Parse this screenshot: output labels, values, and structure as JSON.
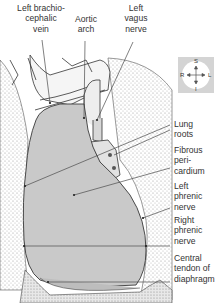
{
  "diagram": {
    "type": "anatomical-illustration",
    "colors": {
      "pericardium_fill": "#c9c9c9",
      "lung_stipple": "#bdbdbd",
      "outline": "#3a3a3a",
      "leader_line": "#4a4a4a",
      "orientation_box": "#d4d4d4"
    }
  },
  "labels": {
    "top": [
      {
        "id": "left-brachiocephalic-vein",
        "lines": [
          "Left brachio-",
          "cephalic",
          "vein"
        ]
      },
      {
        "id": "aortic-arch",
        "lines": [
          "Aortic",
          "arch"
        ]
      },
      {
        "id": "left-vagus-nerve",
        "lines": [
          "Left",
          "vagus",
          "nerve"
        ]
      }
    ],
    "right": [
      {
        "id": "lung-roots",
        "lines": [
          "Lung",
          "roots"
        ]
      },
      {
        "id": "fibrous-pericardium",
        "lines": [
          "Fibrous",
          "peri-",
          "cardium"
        ]
      },
      {
        "id": "left-phrenic-nerve",
        "lines": [
          "Left",
          "phrenic",
          "nerve"
        ]
      },
      {
        "id": "right-phrenic-nerve",
        "lines": [
          "Right",
          "phrenic",
          "nerve"
        ]
      },
      {
        "id": "central-tendon",
        "lines": [
          "Central",
          "tendon of",
          "diaphragm"
        ]
      }
    ]
  },
  "orientation": {
    "superior": "S",
    "inferior": "I",
    "right": "R",
    "left": "L"
  }
}
